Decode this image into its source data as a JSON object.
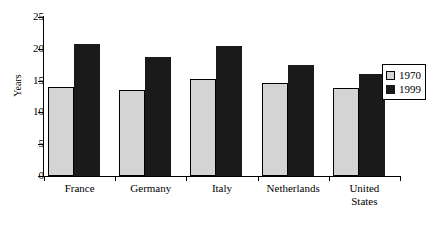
{
  "chart_data": {
    "type": "bar",
    "title": "",
    "xlabel": "",
    "ylabel": "Years",
    "ylim": [
      0,
      25
    ],
    "yticks": [
      0,
      5,
      10,
      15,
      20,
      25
    ],
    "grid": false,
    "legend_position": "right",
    "categories": [
      "France",
      "Germany",
      "Italy",
      "Netherlands",
      "United States"
    ],
    "category_lines": [
      [
        "France"
      ],
      [
        "Germany"
      ],
      [
        "Italy"
      ],
      [
        "Netherlands"
      ],
      [
        "United",
        "States"
      ]
    ],
    "series": [
      {
        "name": "1970",
        "color": "#d4d4d4",
        "values": [
          14.0,
          13.5,
          15.2,
          14.6,
          13.8
        ]
      },
      {
        "name": "1999",
        "color": "#1a1a1a",
        "values": [
          20.8,
          18.7,
          20.4,
          17.4,
          16.1
        ]
      }
    ]
  },
  "legend": {
    "items": [
      {
        "label": "1970"
      },
      {
        "label": "1999"
      }
    ]
  },
  "axis": {
    "y_title": "Years",
    "y_tick_labels": [
      "25",
      "20",
      "15",
      "10",
      "5",
      "0"
    ]
  }
}
